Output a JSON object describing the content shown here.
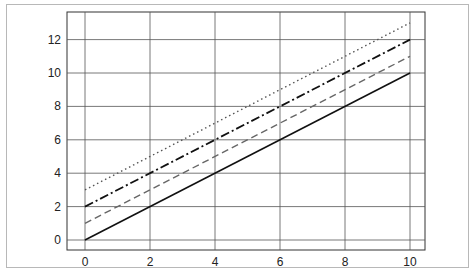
{
  "chart_data": {
    "type": "line",
    "title": "",
    "xlabel": "",
    "ylabel": "",
    "xlim": [
      -1,
      11.1
    ],
    "ylim": [
      -0.7,
      13.9
    ],
    "grid": true,
    "legend": null,
    "x": [
      0,
      10
    ],
    "x_ticks": [
      "0",
      "2",
      "4",
      "6",
      "8",
      "10"
    ],
    "y_ticks": [
      "0",
      "2",
      "4",
      "6",
      "8",
      "10",
      "12"
    ],
    "series": [
      {
        "name": "y = x",
        "style": "solid",
        "color": "#111111",
        "values": [
          0,
          10
        ]
      },
      {
        "name": "y = x + 1",
        "style": "dashed",
        "color": "#666666",
        "values": [
          1,
          11
        ]
      },
      {
        "name": "y = x + 2",
        "style": "dashdot",
        "color": "#111111",
        "values": [
          2,
          12
        ]
      },
      {
        "name": "y = x + 3",
        "style": "dotted",
        "color": "#555555",
        "values": [
          3,
          13
        ]
      }
    ]
  }
}
